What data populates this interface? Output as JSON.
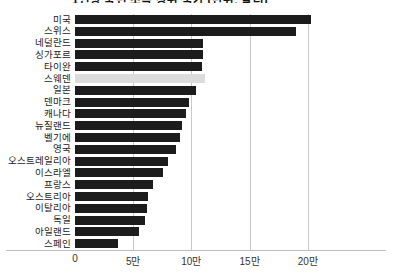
{
  "chart_data": {
    "type": "bar",
    "orientation": "horizontal",
    "title": "1인당 국민 소득 상위 국가 (단위: 달러)",
    "xlabel": "",
    "ylabel": "",
    "xlim": [
      0,
      220000
    ],
    "grid": true,
    "legend": "none",
    "tick_labels": [
      "0",
      "5만",
      "10만",
      "15만",
      "20만"
    ],
    "tick_values": [
      0,
      50000,
      100000,
      150000,
      200000
    ],
    "highlight_category": "스웨덴",
    "colors": {
      "bar": "#1c1c1c",
      "highlight_bar": "#dcdcdc",
      "gridline": "#c9c9c9",
      "axis": "#bdbdbd",
      "text": "#1a1a1a",
      "background": "#ffffff"
    },
    "categories": [
      "미국",
      "스위스",
      "네덜란드",
      "싱가포르",
      "타이완",
      "스웨덴",
      "일본",
      "덴마크",
      "캐나다",
      "뉴질랜드",
      "벨기에",
      "영국",
      "오스트레일리아",
      "이스라엘",
      "프랑스",
      "오스트리아",
      "이탈리아",
      "독일",
      "아일랜드",
      "스페인"
    ],
    "values": [
      203000,
      190000,
      110000,
      110000,
      109000,
      112000,
      104000,
      98000,
      95000,
      92000,
      90000,
      87000,
      80000,
      76000,
      67000,
      63000,
      62000,
      60000,
      55000,
      37000
    ],
    "bars": [
      {
        "category": "미국",
        "value": 203000,
        "highlighted": false
      },
      {
        "category": "스위스",
        "value": 190000,
        "highlighted": false
      },
      {
        "category": "네덜란드",
        "value": 110000,
        "highlighted": false
      },
      {
        "category": "싱가포르",
        "value": 110000,
        "highlighted": false
      },
      {
        "category": "타이완",
        "value": 109000,
        "highlighted": false
      },
      {
        "category": "스웨덴",
        "value": 112000,
        "highlighted": true
      },
      {
        "category": "일본",
        "value": 104000,
        "highlighted": false
      },
      {
        "category": "덴마크",
        "value": 98000,
        "highlighted": false
      },
      {
        "category": "캐나다",
        "value": 95000,
        "highlighted": false
      },
      {
        "category": "뉴질랜드",
        "value": 92000,
        "highlighted": false
      },
      {
        "category": "벨기에",
        "value": 90000,
        "highlighted": false
      },
      {
        "category": "영국",
        "value": 87000,
        "highlighted": false
      },
      {
        "category": "오스트레일리아",
        "value": 80000,
        "highlighted": false
      },
      {
        "category": "이스라엘",
        "value": 76000,
        "highlighted": false
      },
      {
        "category": "프랑스",
        "value": 67000,
        "highlighted": false
      },
      {
        "category": "오스트리아",
        "value": 63000,
        "highlighted": false
      },
      {
        "category": "이탈리아",
        "value": 62000,
        "highlighted": false
      },
      {
        "category": "독일",
        "value": 60000,
        "highlighted": false
      },
      {
        "category": "아일랜드",
        "value": 55000,
        "highlighted": false
      },
      {
        "category": "스페인",
        "value": 37000,
        "highlighted": false
      }
    ]
  }
}
